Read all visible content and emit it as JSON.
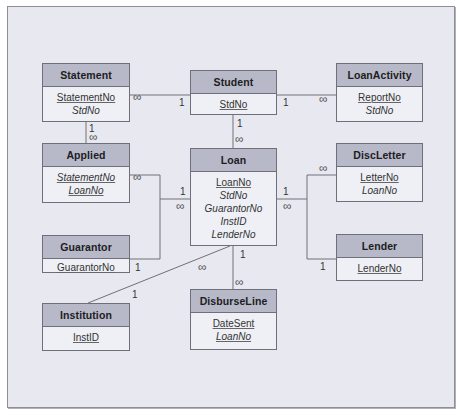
{
  "entities": {
    "statement": {
      "name": "Statement",
      "fields": [
        {
          "label": "StatementNo",
          "pk": true,
          "fk": false
        },
        {
          "label": "StdNo",
          "pk": false,
          "fk": true
        }
      ]
    },
    "student": {
      "name": "Student",
      "fields": [
        {
          "label": "StdNo",
          "pk": true,
          "fk": false
        }
      ]
    },
    "loanactivity": {
      "name": "LoanActivity",
      "fields": [
        {
          "label": "ReportNo",
          "pk": true,
          "fk": false
        },
        {
          "label": "StdNo",
          "pk": false,
          "fk": true
        }
      ]
    },
    "applied": {
      "name": "Applied",
      "fields": [
        {
          "label": "StatementNo",
          "pk": true,
          "fk": true
        },
        {
          "label": "LoanNo",
          "pk": true,
          "fk": true
        }
      ]
    },
    "loan": {
      "name": "Loan",
      "fields": [
        {
          "label": "LoanNo",
          "pk": true,
          "fk": false
        },
        {
          "label": "StdNo",
          "pk": false,
          "fk": true
        },
        {
          "label": "GuarantorNo",
          "pk": false,
          "fk": true
        },
        {
          "label": "InstID",
          "pk": false,
          "fk": true
        },
        {
          "label": "LenderNo",
          "pk": false,
          "fk": true
        }
      ]
    },
    "discletter": {
      "name": "DiscLetter",
      "fields": [
        {
          "label": "LetterNo",
          "pk": true,
          "fk": false
        },
        {
          "label": "LoanNo",
          "pk": false,
          "fk": true
        }
      ]
    },
    "guarantor": {
      "name": "Guarantor",
      "fields": [
        {
          "label": "GuarantorNo",
          "pk": true,
          "fk": false
        }
      ]
    },
    "lender": {
      "name": "Lender",
      "fields": [
        {
          "label": "LenderNo",
          "pk": true,
          "fk": false
        }
      ]
    },
    "institution": {
      "name": "Institution",
      "fields": [
        {
          "label": "InstID",
          "pk": true,
          "fk": false
        }
      ]
    },
    "disburseline": {
      "name": "DisburseLine",
      "fields": [
        {
          "label": "DateSent",
          "pk": true,
          "fk": false
        },
        {
          "label": "LoanNo",
          "pk": true,
          "fk": true
        }
      ]
    }
  },
  "cardinality": {
    "one": "1",
    "many": "∞"
  },
  "relationships": [
    {
      "from": "Student",
      "to": "Statement",
      "from_card": "1",
      "to_card": "∞"
    },
    {
      "from": "Student",
      "to": "LoanActivity",
      "from_card": "1",
      "to_card": "∞"
    },
    {
      "from": "Student",
      "to": "Loan",
      "from_card": "1",
      "to_card": "∞"
    },
    {
      "from": "Statement",
      "to": "Applied",
      "from_card": "1",
      "to_card": "∞"
    },
    {
      "from": "Loan",
      "to": "Applied",
      "from_card": "1",
      "to_card": "∞"
    },
    {
      "from": "Guarantor",
      "to": "Loan",
      "from_card": "1",
      "to_card": "∞"
    },
    {
      "from": "Institution",
      "to": "Loan",
      "from_card": "1",
      "to_card": "∞"
    },
    {
      "from": "Loan",
      "to": "DisburseLine",
      "from_card": "1",
      "to_card": "∞"
    },
    {
      "from": "Loan",
      "to": "DiscLetter",
      "from_card": "1",
      "to_card": "∞"
    },
    {
      "from": "Lender",
      "to": "Loan",
      "from_card": "1",
      "to_card": "∞"
    }
  ],
  "colors": {
    "background": "#e8e9f0",
    "header": "#b7b8c8",
    "body": "#eef0f6",
    "border": "#6e6f78"
  }
}
